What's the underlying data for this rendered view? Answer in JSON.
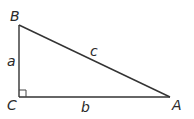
{
  "diagram": {
    "type": "right-triangle",
    "vertices": {
      "A": {
        "label": "A",
        "x": 170,
        "y": 97
      },
      "B": {
        "label": "B",
        "x": 19,
        "y": 25
      },
      "C": {
        "label": "C",
        "x": 19,
        "y": 97
      }
    },
    "sides": {
      "a": {
        "label": "a",
        "between": [
          "B",
          "C"
        ]
      },
      "b": {
        "label": "b",
        "between": [
          "C",
          "A"
        ]
      },
      "c": {
        "label": "c",
        "between": [
          "B",
          "A"
        ]
      }
    },
    "right_angle_at": "C",
    "colors": {
      "stroke": "#333333",
      "text": "#2a2a2a",
      "background": "#ffffff"
    }
  }
}
